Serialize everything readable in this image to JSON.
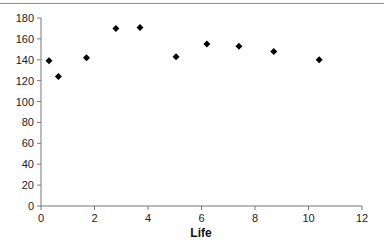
{
  "chart_data": {
    "type": "scatter",
    "title": "",
    "xlabel": "Life",
    "ylabel": "",
    "xlim": [
      0,
      12
    ],
    "ylim": [
      0,
      180
    ],
    "xticks": [
      0,
      2,
      4,
      6,
      8,
      10,
      12
    ],
    "yticks": [
      0,
      20,
      40,
      60,
      80,
      100,
      120,
      140,
      160,
      180
    ],
    "grid": false,
    "legend": null,
    "marker": "diamond",
    "marker_color": "#000000",
    "series": [
      {
        "name": "",
        "points": [
          {
            "x": 0.3,
            "y": 139
          },
          {
            "x": 0.65,
            "y": 124
          },
          {
            "x": 1.7,
            "y": 142
          },
          {
            "x": 2.8,
            "y": 170
          },
          {
            "x": 3.7,
            "y": 171
          },
          {
            "x": 5.05,
            "y": 143
          },
          {
            "x": 6.2,
            "y": 155
          },
          {
            "x": 7.4,
            "y": 153
          },
          {
            "x": 8.7,
            "y": 148
          },
          {
            "x": 10.4,
            "y": 140
          }
        ]
      }
    ]
  }
}
